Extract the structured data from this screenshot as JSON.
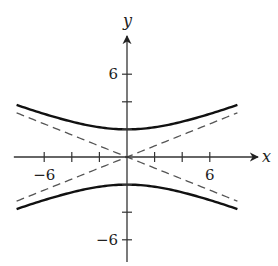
{
  "chart_data": {
    "type": "line",
    "title": "",
    "xlabel": "x",
    "ylabel": "y",
    "xlim": [
      -8.2,
      8.2
    ],
    "ylim": [
      -8.5,
      9
    ],
    "xticks": [
      -6,
      -4,
      -2,
      2,
      4,
      6
    ],
    "yticks": [
      -6,
      -4,
      -2,
      2,
      4,
      6
    ],
    "xtick_labels": [
      {
        "value": -6,
        "label": "−6"
      },
      {
        "value": 6,
        "label": "6"
      }
    ],
    "ytick_labels": [
      {
        "value": 6,
        "label": "6"
      },
      {
        "value": -6,
        "label": "−6"
      }
    ],
    "grid": false,
    "series": [
      {
        "name": "hyperbola upper branch",
        "equation": "y^2/4 - x^2/25 = 1, y>0",
        "a": 2,
        "b": 5,
        "branch": 1,
        "style": "solid",
        "x_range": [
          -8,
          8
        ]
      },
      {
        "name": "hyperbola lower branch",
        "equation": "y^2/4 - x^2/25 = 1, y<0",
        "a": 2,
        "b": 5,
        "branch": -1,
        "style": "solid",
        "x_range": [
          -8,
          8
        ]
      },
      {
        "name": "asymptote y = 2x/5",
        "slope": 0.4,
        "style": "dashed",
        "x_range": [
          -8,
          8
        ]
      },
      {
        "name": "asymptote y = -2x/5",
        "slope": -0.4,
        "style": "dashed",
        "x_range": [
          -8,
          8
        ]
      }
    ]
  }
}
